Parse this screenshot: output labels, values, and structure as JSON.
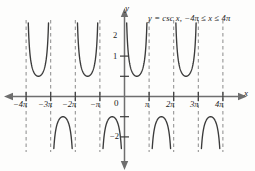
{
  "figure": {
    "equation_label": "y = csc x, −4π ≤ x ≤ 4π",
    "x_axis_label": "x",
    "y_axis_label": "y",
    "origin_label": "0"
  },
  "axes": {
    "x_ticks": [
      {
        "label": "−4π",
        "value": -4
      },
      {
        "label": "−3π",
        "value": -3
      },
      {
        "label": "−2π",
        "value": -2
      },
      {
        "label": "−π",
        "value": -1
      },
      {
        "label": "π",
        "value": 1
      },
      {
        "label": "2π",
        "value": 2
      },
      {
        "label": "3π",
        "value": 3
      },
      {
        "label": "4π",
        "value": 4
      }
    ],
    "y_ticks": [
      {
        "label": "2",
        "value": 2
      },
      {
        "label": "1",
        "value": 1
      },
      {
        "label": "",
        "value": -1
      },
      {
        "label": "−2",
        "value": -2
      }
    ]
  },
  "colors": {
    "curve": "#3b3b3b",
    "axis": "#6e6e6e",
    "asymptote": "#8a8a8a",
    "text": "#1b1b1b",
    "background": "#fdfdfc"
  },
  "chart_data": {
    "type": "line",
    "title": "y = csc x, −4π ≤ x ≤ 4π",
    "function": "y = csc x",
    "xlabel": "x",
    "ylabel": "y",
    "xlim": [
      -4,
      4
    ],
    "ylim": [
      -2.9,
      2.9
    ],
    "x_unit": "pi",
    "grid": false,
    "legend": "none",
    "xticks": [
      -4,
      -3,
      -2,
      -1,
      0,
      1,
      2,
      3,
      4
    ],
    "xticklabels": [
      "−4π",
      "−3π",
      "−2π",
      "−π",
      "0",
      "π",
      "2π",
      "3π",
      "4π"
    ],
    "yticks": [
      2,
      1,
      -1,
      -2
    ],
    "yticklabels": [
      "2",
      "1",
      "",
      "−2"
    ],
    "asymptotes": [
      -4,
      -3,
      -2,
      -1,
      0,
      1,
      2,
      3,
      4
    ],
    "asymptote_labels": [
      "−4π",
      "−3π",
      "−2π",
      "−π",
      "0",
      "π",
      "2π",
      "3π",
      "4π"
    ],
    "branches": [
      {
        "interval_pi": [
          -4,
          -3
        ],
        "direction": "up",
        "extremum": 1
      },
      {
        "interval_pi": [
          -3,
          -2
        ],
        "direction": "down",
        "extremum": -1
      },
      {
        "interval_pi": [
          -2,
          -1
        ],
        "direction": "up",
        "extremum": 1
      },
      {
        "interval_pi": [
          -1,
          0
        ],
        "direction": "down",
        "extremum": -1
      },
      {
        "interval_pi": [
          0,
          1
        ],
        "direction": "up",
        "extremum": 1
      },
      {
        "interval_pi": [
          1,
          2
        ],
        "direction": "down",
        "extremum": -1
      },
      {
        "interval_pi": [
          2,
          3
        ],
        "direction": "up",
        "extremum": 1
      },
      {
        "interval_pi": [
          3,
          4
        ],
        "direction": "down",
        "extremum": -1
      }
    ]
  }
}
